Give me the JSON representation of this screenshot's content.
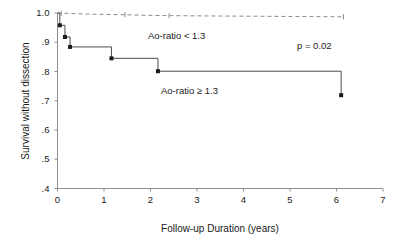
{
  "chart_data": {
    "type": "line",
    "subtype": "kaplan-meier-step",
    "title": "",
    "xlabel": "Follow-up Duration (years)",
    "ylabel": "Survival without dissection",
    "xlim": [
      0,
      7
    ],
    "ylim": [
      0.4,
      1.0
    ],
    "xticks": [
      0,
      1,
      2,
      3,
      4,
      5,
      6,
      7
    ],
    "xtick_labels": [
      "0",
      "1",
      "2",
      "3",
      "4",
      "5",
      "6",
      "7"
    ],
    "yticks": [
      0.4,
      0.5,
      0.6,
      0.7,
      0.8,
      0.9,
      1.0
    ],
    "ytick_labels": [
      ".4",
      ".5",
      ".6",
      ".7",
      ".8",
      ".9",
      "1.0"
    ],
    "grid": false,
    "legend_position": "inline-annotations",
    "series": [
      {
        "name": "Ao-ratio < 1.3",
        "style": "dashed",
        "color": "#8c8c8c",
        "x": [
          0.0,
          0.35,
          0.7,
          1.05,
          1.45,
          1.9,
          2.4,
          3.2,
          4.2,
          5.2,
          6.15
        ],
        "y": [
          1.0,
          0.998,
          0.996,
          0.995,
          0.994,
          0.992,
          0.991,
          0.99,
          0.989,
          0.988,
          0.987
        ],
        "censor_x": [
          0.08,
          1.45,
          2.4,
          6.15
        ],
        "censor_y": [
          0.999,
          0.994,
          0.991,
          0.987
        ]
      },
      {
        "name": "Ao-ratio ≥ 1.3",
        "style": "solid-step",
        "color": "#4d4d4d",
        "x": [
          0.0,
          0.05,
          0.16,
          0.27,
          1.16,
          2.16,
          6.1
        ],
        "y": [
          1.0,
          0.958,
          0.918,
          0.884,
          0.845,
          0.801,
          0.719
        ],
        "event_marker_x": [
          0.05,
          0.16,
          0.27,
          1.16,
          2.16,
          6.1
        ],
        "event_marker_y": [
          0.958,
          0.918,
          0.884,
          0.845,
          0.801,
          0.719
        ]
      }
    ],
    "annotations": [
      {
        "text": "Ao-ratio < 1.3",
        "x": 1.9,
        "y": 0.955
      },
      {
        "text": "Ao-ratio ≥ 1.3",
        "x": 2.2,
        "y": 0.77
      },
      {
        "text": "p = 0.02",
        "x": 5.2,
        "y": 0.92
      }
    ]
  },
  "axis": {
    "ylabel": "Survival without dissection",
    "xlabel": "Follow-up Duration (years)",
    "ytick_labels": [
      "1.0",
      ".9",
      ".8",
      ".7",
      ".6",
      ".5",
      ".4"
    ],
    "xtick_labels": [
      "0",
      "1",
      "2",
      "3",
      "4",
      "5",
      "6",
      "7"
    ]
  },
  "annotations": {
    "upper_group": "Ao-ratio < 1.3",
    "lower_group": "Ao-ratio ≥ 1.3",
    "pvalue": "p = 0.02"
  },
  "colors": {
    "axis": "#8f8f8f",
    "dashed_series": "#8c8c8c",
    "solid_series": "#4d4d4d",
    "text": "#1a1a1a",
    "background": "#ffffff"
  }
}
